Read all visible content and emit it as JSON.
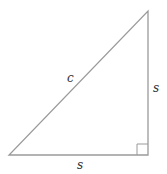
{
  "diagram": {
    "type": "right-isosceles-triangle",
    "labels": {
      "hypotenuse": "c",
      "vertical_leg": "s",
      "horizontal_leg": "s"
    },
    "colors": {
      "stroke": "#9a9a9a",
      "label": "#333333",
      "background": "#ffffff"
    },
    "right_angle_marker": true
  }
}
